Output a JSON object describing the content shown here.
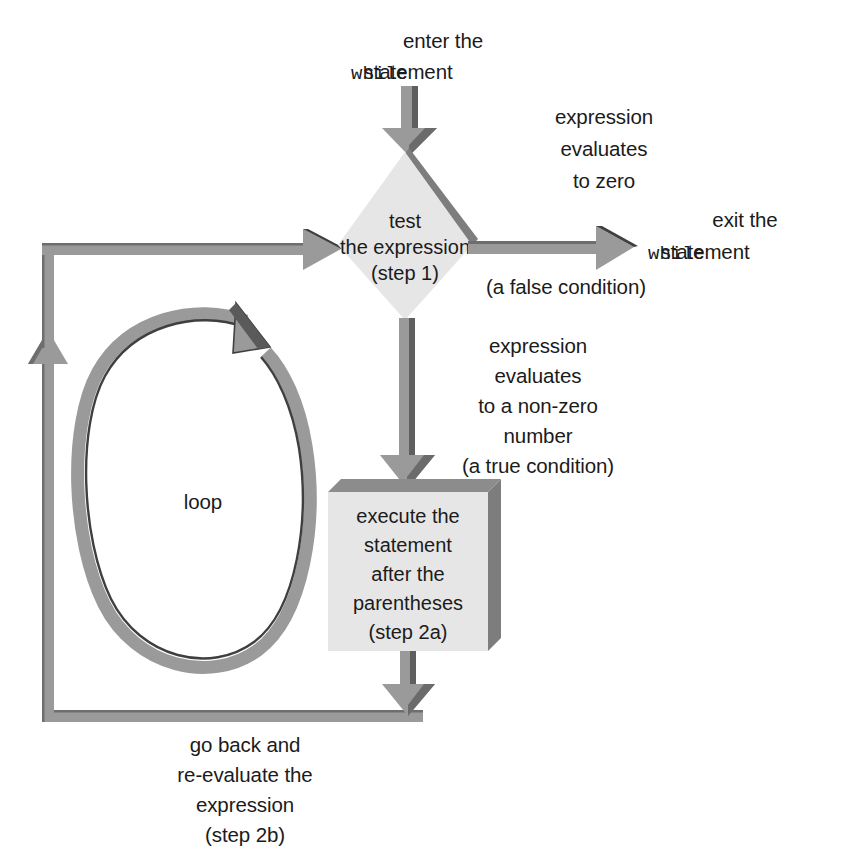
{
  "diagram": {
    "colors": {
      "arrow_fill": "#8f8f8f",
      "arrow_edge": "#4a4a4a",
      "node_fill": "#e6e6e6",
      "node_shadow": "#7d7d7d",
      "text": "#1b1b1b",
      "background": "#ffffff"
    }
  },
  "labels": {
    "enter": {
      "line1": "enter the",
      "line2_mono": "while",
      "line2_rest": " statement"
    },
    "false_branch": {
      "line1": "expression",
      "line2": "evaluates",
      "line3": "to zero"
    },
    "exit": {
      "line1": "exit the",
      "line2_mono": "while",
      "line2_rest": " statement"
    },
    "false_condition": "(a false condition)",
    "true_branch": {
      "line1": "expression",
      "line2": "evaluates",
      "line3": "to a non-zero",
      "line4": "number",
      "line5": "(a true condition)"
    },
    "loop": "loop",
    "go_back": {
      "line1": "go back and",
      "line2": "re-evaluate the",
      "line3": "expression",
      "line4": "(step 2b)"
    }
  },
  "nodes": {
    "decision": {
      "shape": "diamond",
      "line1": "test",
      "line2": "the expression",
      "line3": "(step 1)"
    },
    "process": {
      "shape": "rectangle",
      "line1": "execute the",
      "line2": "statement",
      "line3": "after the",
      "line4": "parentheses",
      "line5": "(step 2a)"
    }
  }
}
